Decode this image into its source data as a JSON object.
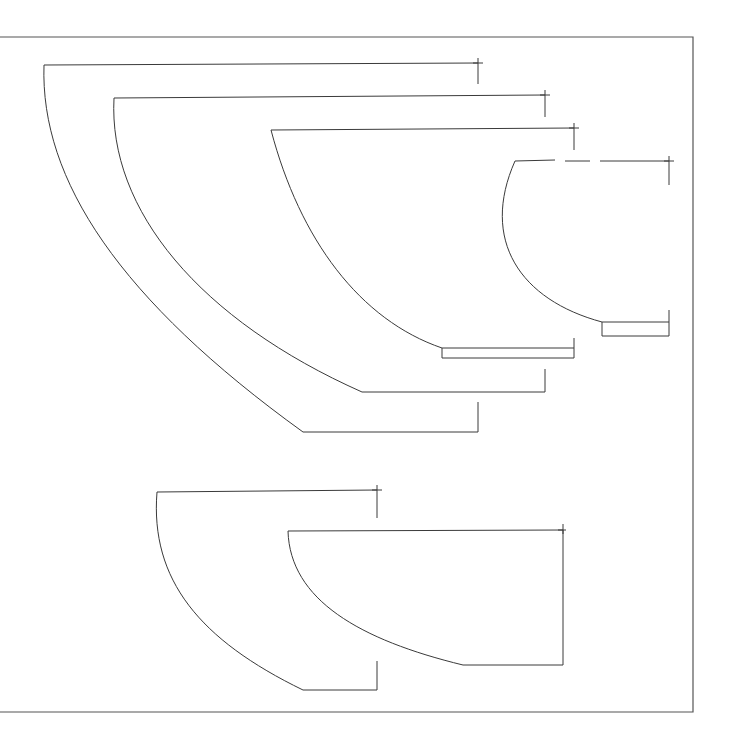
{
  "drawing": {
    "type": "technical line drawing of vessel/bowl profiles",
    "stroke_color": "#3a3a3a",
    "background": "#ffffff",
    "frame": {
      "x1": 0,
      "y1": 37,
      "x2": 693,
      "y2": 712
    },
    "profiles": [
      {
        "id": "profile-1",
        "rim_y": 64,
        "rim_left_x": 44,
        "rim_right_x": 478,
        "base_y": 432,
        "base_left_x": 303,
        "base_right_x": 478
      },
      {
        "id": "profile-2",
        "rim_y": 97,
        "rim_left_x": 114,
        "rim_right_x": 545,
        "base_y": 392,
        "base_left_x": 362,
        "base_right_x": 545
      },
      {
        "id": "profile-3",
        "rim_y": 129,
        "rim_left_x": 271,
        "rim_right_x": 574,
        "base_y": 348,
        "base_left_x": 442,
        "base_right_x": 574
      },
      {
        "id": "profile-4",
        "rim_y": 160,
        "rim_left_x": 515,
        "rim_right_x": 669,
        "base_y": 322,
        "base_left_x": 602,
        "base_right_x": 669
      },
      {
        "id": "profile-5",
        "rim_y": 492,
        "rim_left_x": 157,
        "rim_right_x": 377,
        "base_y": 690,
        "base_left_x": 303,
        "base_right_x": 377
      },
      {
        "id": "profile-6",
        "rim_y": 531,
        "rim_left_x": 288,
        "rim_right_x": 563,
        "base_y": 665,
        "base_left_x": 463,
        "base_right_x": 563
      }
    ]
  }
}
